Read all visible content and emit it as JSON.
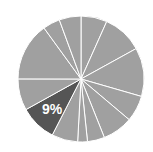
{
  "chart_data": {
    "type": "pie",
    "title": "",
    "start_angle_deg": 0,
    "direction": "clockwise",
    "colors": {
      "default_slice": "#a0a0a0",
      "highlight_slice": "#555555",
      "separator": "#ffffff",
      "label": "#ffffff"
    },
    "slices": [
      {
        "value": 6.7,
        "label": "",
        "highlight": false
      },
      {
        "value": 10.3,
        "label": "",
        "highlight": false
      },
      {
        "value": 12.5,
        "label": "",
        "highlight": false
      },
      {
        "value": 6.7,
        "label": "",
        "highlight": false
      },
      {
        "value": 7.8,
        "label": "",
        "highlight": false
      },
      {
        "value": 4.4,
        "label": "",
        "highlight": false
      },
      {
        "value": 2.5,
        "label": "",
        "highlight": false
      },
      {
        "value": 6.7,
        "label": "",
        "highlight": false
      },
      {
        "value": 9.4,
        "label": "9%",
        "highlight": true
      },
      {
        "value": 8.1,
        "label": "",
        "highlight": false
      },
      {
        "value": 15.0,
        "label": "",
        "highlight": false
      },
      {
        "value": 4.4,
        "label": "",
        "highlight": false
      },
      {
        "value": 5.6,
        "label": "",
        "highlight": false
      }
    ],
    "visible_labels": [
      "9%"
    ],
    "legend": null,
    "grid": false
  },
  "geometry": {
    "cx": 81,
    "cy": 79,
    "r": 63
  }
}
